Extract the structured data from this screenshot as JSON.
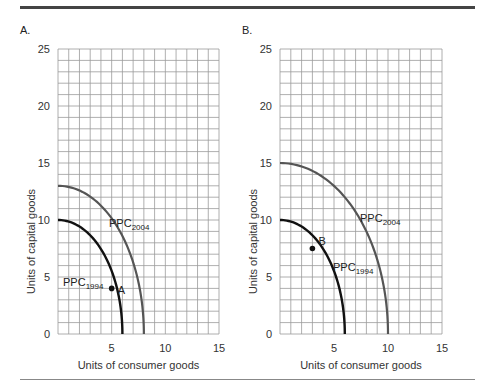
{
  "chart_data": [
    {
      "type": "line",
      "panel": "A.",
      "title": "",
      "xlabel": "Units of consumer goods",
      "ylabel": "Units of capital goods",
      "xlim": [
        0,
        15
      ],
      "ylim": [
        0,
        25
      ],
      "xticks": [
        0,
        5,
        10,
        15
      ],
      "yticks": [
        0,
        5,
        10,
        15,
        20,
        25
      ],
      "x_tick_labels": [
        "5",
        "10",
        "15"
      ],
      "y_tick_labels": [
        "0",
        "5",
        "10",
        "15",
        "20",
        "25"
      ],
      "grid": true,
      "grid_step": 1,
      "series": [
        {
          "name": "PPC1994",
          "label": "PPC",
          "subscript": "1994",
          "y_intercept": 10,
          "x_intercept": 6,
          "color": "#111111"
        },
        {
          "name": "PPC2004",
          "label": "PPC",
          "subscript": "2004",
          "y_intercept": 13,
          "x_intercept": 8,
          "color": "#555555"
        }
      ],
      "points": [
        {
          "label": "A",
          "x": 5,
          "y": 4,
          "on": "PPC1994"
        }
      ]
    },
    {
      "type": "line",
      "panel": "B.",
      "title": "",
      "xlabel": "Units of consumer goods",
      "ylabel": "Units of capital goods",
      "xlim": [
        0,
        15
      ],
      "ylim": [
        0,
        25
      ],
      "xticks": [
        0,
        5,
        10,
        15
      ],
      "yticks": [
        0,
        5,
        10,
        15,
        20,
        25
      ],
      "x_tick_labels": [
        "5",
        "10",
        "15"
      ],
      "y_tick_labels": [
        "0",
        "5",
        "10",
        "15",
        "20",
        "25"
      ],
      "grid": true,
      "grid_step": 1,
      "series": [
        {
          "name": "PPC1994",
          "label": "PPC",
          "subscript": "1994",
          "y_intercept": 10,
          "x_intercept": 6,
          "color": "#111111"
        },
        {
          "name": "PPC2004",
          "label": "PPC",
          "subscript": "2004",
          "y_intercept": 15,
          "x_intercept": 10,
          "color": "#555555"
        }
      ],
      "points": [
        {
          "label": "B",
          "x": 3,
          "y": 7.5,
          "on": "PPC1994"
        }
      ]
    }
  ],
  "colors": {
    "grid": "#9a9a9a",
    "ppc1994": "#111111",
    "ppc2004": "#555555",
    "rule_top": "#444444",
    "rule_bottom": "#888888"
  }
}
